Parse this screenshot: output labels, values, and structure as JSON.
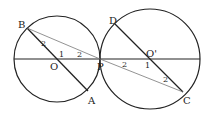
{
  "diagram": {
    "points": {
      "B": {
        "label": "B",
        "x": 26,
        "y": 27
      },
      "A": {
        "label": "A",
        "x": 88,
        "y": 94
      },
      "O": {
        "label": "O",
        "x": 57,
        "y": 59
      },
      "P": {
        "label": "P",
        "x": 100,
        "y": 59
      },
      "D": {
        "label": "D",
        "x": 115,
        "y": 23
      },
      "O_prime": {
        "label": "O'",
        "x": 150,
        "y": 59
      },
      "C": {
        "label": "C",
        "x": 183,
        "y": 94
      }
    },
    "angle_labels": {
      "left_angle2_at_B": "2",
      "left_angle1_at_O": "1",
      "left_angle2_at_P": "2",
      "right_angle2_at_P": "2",
      "right_angle1_at_O_prime": "1",
      "right_angle2_at_C": "2"
    },
    "colors": {
      "stroke": "#222222",
      "thin": "#777777",
      "background": "#ffffff"
    }
  }
}
